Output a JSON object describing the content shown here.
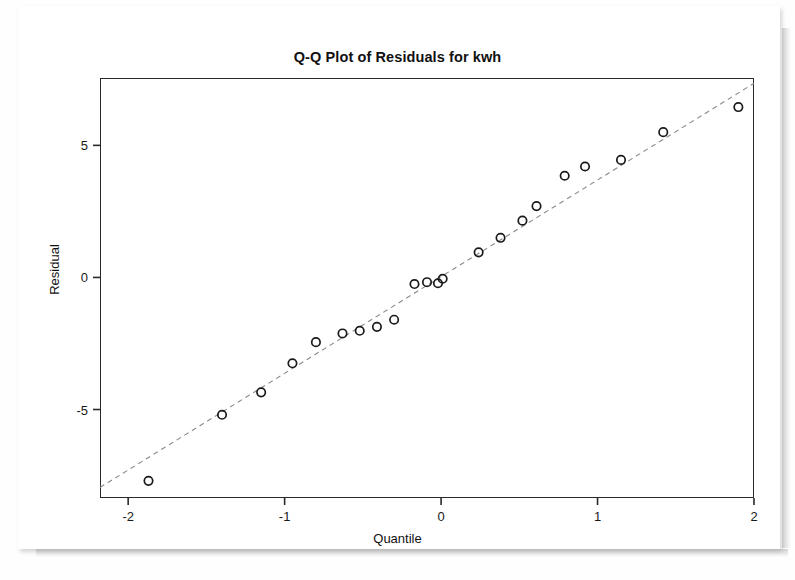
{
  "figure": {
    "background_color": "#fefefe",
    "frame_color": "#2a2a2a",
    "marker_color": "#1a1a1a",
    "reference_line_color": "#8a8a8a"
  },
  "chart_data": {
    "type": "scatter",
    "title": "Q-Q Plot of Residuals for kwh",
    "xlabel": "Quantile",
    "ylabel": "Residual",
    "xlim": [
      -2.18,
      2.0
    ],
    "ylim": [
      -8.35,
      7.55
    ],
    "xticks": [
      -2,
      -1,
      0,
      1,
      2
    ],
    "xtick_labels": [
      "-2",
      "-1",
      "0",
      "1",
      "2"
    ],
    "yticks": [
      5,
      0,
      -5
    ],
    "ytick_labels": [
      "5",
      "0",
      "-5"
    ],
    "grid": false,
    "legend": null,
    "series": [
      {
        "name": "Residual quantiles",
        "marker": "open-circle",
        "x": [
          -1.87,
          -1.4,
          -1.15,
          -0.95,
          -0.8,
          -0.63,
          -0.52,
          -0.41,
          -0.3,
          -0.17,
          -0.09,
          -0.01,
          0.06,
          0.14,
          0.24,
          0.33,
          0.41,
          0.52,
          0.62,
          0.79,
          0.92,
          1.15,
          1.42,
          1.9
        ],
        "y": [
          -7.7,
          -5.2,
          -4.35,
          -3.25,
          -2.45,
          -2.1,
          -2.0,
          -1.85,
          -1.6,
          -0.25,
          -0.2,
          -0.05,
          0.95,
          1.45,
          2.15,
          2.7,
          3.85,
          4.2,
          4.45,
          5.5,
          6.45,
          0,
          0,
          0
        ]
      }
    ],
    "points": [
      {
        "x": -1.87,
        "y": -7.7
      },
      {
        "x": -1.4,
        "y": -5.2
      },
      {
        "x": -1.15,
        "y": -4.35
      },
      {
        "x": -0.95,
        "y": -3.25
      },
      {
        "x": -0.8,
        "y": -2.45
      },
      {
        "x": -0.63,
        "y": -2.12
      },
      {
        "x": -0.52,
        "y": -2.02
      },
      {
        "x": -0.41,
        "y": -1.87
      },
      {
        "x": -0.3,
        "y": -1.6
      },
      {
        "x": -0.17,
        "y": -0.25
      },
      {
        "x": -0.09,
        "y": -0.18
      },
      {
        "x": 0.01,
        "y": -0.05
      },
      {
        "x": 0.24,
        "y": 0.95
      },
      {
        "x": 0.38,
        "y": 1.5
      },
      {
        "x": 0.52,
        "y": 2.15
      },
      {
        "x": 0.61,
        "y": 2.7
      },
      {
        "x": 0.79,
        "y": 3.85
      },
      {
        "x": 0.92,
        "y": 4.2
      },
      {
        "x": 1.15,
        "y": 4.45
      },
      {
        "x": 1.42,
        "y": 5.5
      },
      {
        "x": 1.9,
        "y": 6.45
      },
      {
        "x": -0.02,
        "y": -0.22
      }
    ],
    "reference_line": {
      "style": "dashed",
      "from": {
        "x": -2.18,
        "y": -7.95
      },
      "to": {
        "x": 2.0,
        "y": 7.35
      }
    },
    "n_points": 22
  }
}
